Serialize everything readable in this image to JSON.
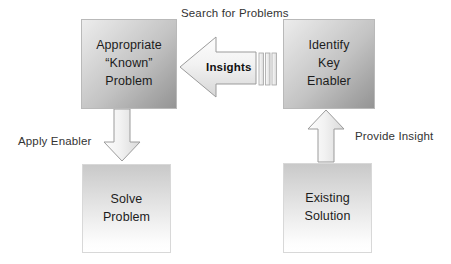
{
  "diagram": {
    "title_text_present": false,
    "background_color": "#ffffff",
    "boxes": [
      {
        "id": "appropriate-problem",
        "label": "Appropriate\n“Known”\nProblem",
        "position": "top-left",
        "fill_style": "gradient-light-to-dark",
        "fill_from": "#ececec",
        "fill_to": "#949494"
      },
      {
        "id": "identify-key-enabler",
        "label": "Identify\nKey\nEnabler",
        "position": "top-right",
        "fill_style": "gradient-light-to-dark",
        "fill_from": "#ececec",
        "fill_to": "#949494"
      },
      {
        "id": "solve-problem",
        "label": "Solve\nProblem",
        "position": "bottom-left",
        "fill_style": "gradient-gray-to-white",
        "fill_from": "#c9c9c9",
        "fill_to": "#ffffff"
      },
      {
        "id": "existing-solution",
        "label": "Existing\nSolution",
        "position": "bottom-right",
        "fill_style": "gradient-gray-to-white",
        "fill_from": "#c9c9c9",
        "fill_to": "#ffffff"
      }
    ],
    "arrows": [
      {
        "id": "insights-arrow",
        "direction": "left",
        "inner_label": "Insights",
        "top_label": "Search for Problems",
        "from": "identify-key-enabler",
        "to": "appropriate-problem",
        "has_striped_tail": true,
        "tail_bar_count": 3
      },
      {
        "id": "apply-enabler-arrow",
        "direction": "down",
        "label": "Apply Enabler",
        "from": "appropriate-problem",
        "to": "solve-problem"
      },
      {
        "id": "provide-insight-arrow",
        "direction": "up",
        "label": "Provide Insight",
        "from": "existing-solution",
        "to": "identify-key-enabler"
      }
    ],
    "labels": {
      "search_for_problems": "Search for Problems",
      "apply_enabler": "Apply Enabler",
      "provide_insight": "Provide Insight",
      "insights": "Insights"
    },
    "colors": {
      "text": "#1c1c1c",
      "label_text": "#333333",
      "arrow_fill_from": "#fbfbfb",
      "arrow_fill_to": "#dcdcdc",
      "arrow_stroke": "#9b9b9b",
      "box_border_top": "#b9b9b9",
      "box_border_bottom": "#d8d8d8"
    }
  }
}
